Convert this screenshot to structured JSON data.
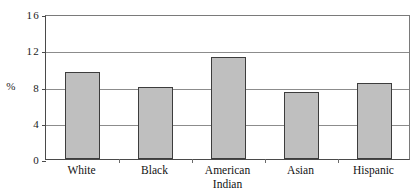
{
  "chart_data": {
    "type": "bar",
    "title": "",
    "subtitle": "",
    "xlabel": "",
    "ylabel": "%",
    "categories": [
      "White",
      "Black",
      "American\nIndian",
      "Asian",
      "Hispanic"
    ],
    "values": [
      9.6,
      7.9,
      11.3,
      7.4,
      8.4
    ],
    "series": [
      {
        "name": "Percent",
        "values": [
          9.6,
          7.9,
          11.3,
          7.4,
          8.4
        ]
      }
    ],
    "ylim": [
      0,
      16
    ],
    "ytick_labels": [
      "0",
      "4",
      "8",
      "12",
      "16"
    ],
    "ytick_values": [
      0,
      4,
      8,
      12,
      16
    ],
    "grid": true,
    "grid_axis": "y",
    "legend": false,
    "legend_position": "none",
    "bar_fill_color": "#bfbfbf",
    "bar_edge_color": "#3d3d3d",
    "grid_color": "#8c8c8c",
    "axis_color": "#4a4a4a",
    "text_color": "#121212"
  }
}
